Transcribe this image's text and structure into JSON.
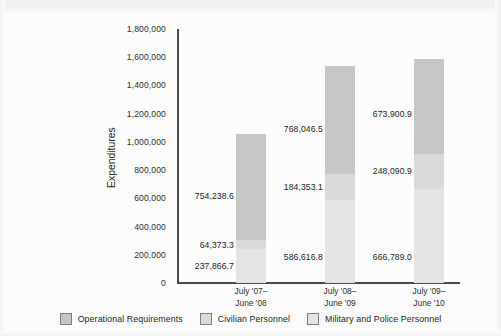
{
  "chart_data": {
    "type": "bar",
    "subtype": "stacked-bar",
    "title": "",
    "xlabel": "",
    "ylabel": "Expenditures",
    "ylim": [
      0,
      1800000
    ],
    "ytick_step": 200000,
    "grid": false,
    "legend_position": "bottom",
    "categories": [
      "July '07–\nJune '08",
      "July '08–\nJune '09",
      "July '09–\nJune '10"
    ],
    "category_lines": [
      [
        "July '07–",
        "June '08"
      ],
      [
        "July '08–",
        "June '09"
      ],
      [
        "July '09–",
        "June '10"
      ]
    ],
    "ytick_labels": [
      "1,800,000",
      "1,600,000",
      "1,400,000",
      "1,200,000",
      "1,000,000",
      "800,000",
      "600,000",
      "400,000",
      "200,000",
      "0"
    ],
    "ytick_values": [
      1800000,
      1600000,
      1400000,
      1200000,
      1000000,
      800000,
      600000,
      400000,
      200000,
      0
    ],
    "series": [
      {
        "name": "Operational Requirements",
        "color": "#c6c6c6",
        "values": [
          754238.6,
          768046.5,
          673900.9
        ],
        "labels": [
          "754,238.6",
          "768,046.5",
          "673,900.9"
        ]
      },
      {
        "name": "Civilian Personnel",
        "color": "#dadada",
        "values": [
          64373.3,
          184353.1,
          248090.9
        ],
        "labels": [
          "64,373.3",
          "184,353.1",
          "248,090.9"
        ]
      },
      {
        "name": "Military and Police Personnel",
        "color": "#e4e4e4",
        "values": [
          237866.7,
          586616.8,
          666789.0
        ],
        "labels": [
          "237,866.7",
          "586,616.8",
          "666,789.0"
        ]
      }
    ],
    "totals": [
      1056478.6,
      1539016.4,
      1588780.8
    ]
  },
  "legend": {
    "items": [
      {
        "label": "Operational Requirements",
        "color": "#c6c6c6"
      },
      {
        "label": "Civilian Personnel",
        "color": "#dadada"
      },
      {
        "label": "Military and Police Personnel",
        "color": "#e4e4e4"
      }
    ]
  }
}
